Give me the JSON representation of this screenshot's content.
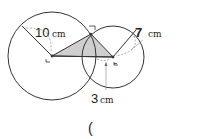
{
  "diagram": {
    "labels": {
      "big_radius_value": "10",
      "big_radius_unit": "cm",
      "small_radius_value": "7",
      "small_radius_unit": "cm",
      "overlap_value": "3",
      "overlap_unit": "cm",
      "answer_paren": "("
    },
    "colors": {
      "stroke": "#333333",
      "shaded_triangle": "#cccccc",
      "dashed": "#888888"
    }
  }
}
